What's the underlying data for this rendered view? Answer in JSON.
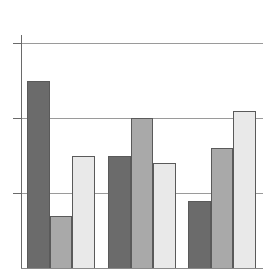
{
  "chart_data": {
    "type": "bar",
    "title": "",
    "xlabel": "",
    "ylabel": "",
    "categories": [
      "",
      "",
      ""
    ],
    "series": [
      {
        "name": "Series 1",
        "color": "#6b6b6b",
        "values": [
          2.5,
          1.5,
          0.9
        ]
      },
      {
        "name": "Series 2",
        "color": "#a9a9a9",
        "values": [
          0.7,
          2.0,
          1.6
        ]
      },
      {
        "name": "Series 3",
        "color": "#e9e9e9",
        "values": [
          1.5,
          1.4,
          2.1
        ]
      }
    ],
    "ylim": [
      0,
      3
    ],
    "yticks": [
      0,
      1,
      2,
      3
    ],
    "grid": true,
    "legend": "none",
    "tick_labels_visible": false
  },
  "layout": {
    "plot_left": 21,
    "plot_right": 263,
    "baseline_y": 268,
    "px_per_unit": 75,
    "axis_top": 35,
    "tick_left": 13,
    "group_starts": [
      27,
      108,
      188
    ],
    "bar_width": 22.5
  }
}
